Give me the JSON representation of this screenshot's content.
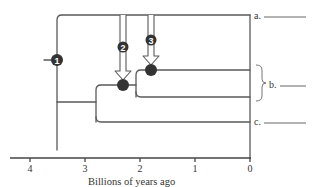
{
  "diagram": {
    "type": "phylogenetic-tree",
    "tips": [
      {
        "id": "a",
        "label": "a.",
        "blank": "________"
      },
      {
        "id": "b",
        "label": "b.",
        "blank": "________",
        "bracket_spans": 2
      },
      {
        "id": "c",
        "label": "c.",
        "blank": "________"
      }
    ],
    "nodes": [
      {
        "id": 1,
        "label": "1",
        "time_bya": 3.5,
        "marker": "numbered-circle-on-branch"
      },
      {
        "id": 2,
        "label": "2",
        "time_bya": 2.3,
        "marker": "hollow-arrow"
      },
      {
        "id": 3,
        "label": "3",
        "time_bya": 1.8,
        "marker": "hollow-arrow"
      }
    ],
    "axis": {
      "title": "Billions of years ago",
      "ticks": [
        "4",
        "3",
        "2",
        "1",
        "0"
      ],
      "range": [
        4.4,
        0
      ]
    },
    "colors": {
      "line": "#555555",
      "node_fill": "#333333",
      "node_text": "#ffffff",
      "background": "#ffffff"
    }
  }
}
